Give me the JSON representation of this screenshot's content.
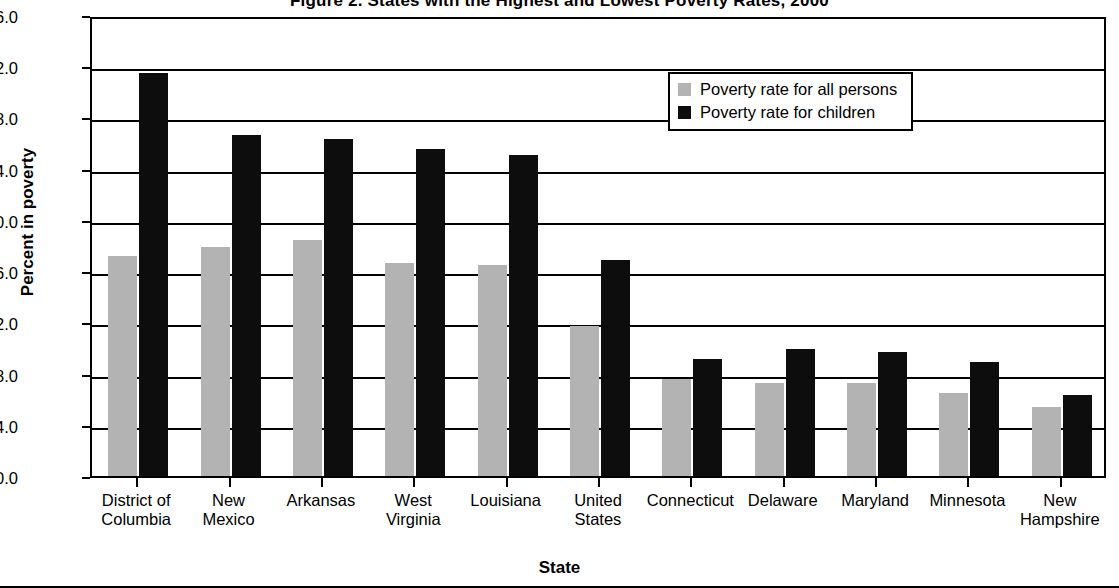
{
  "chart_data": {
    "type": "bar",
    "title": "Figure 2. States with the Highest and Lowest Poverty Rates, 2000",
    "xlabel": "State",
    "ylabel": "Percent in poverty",
    "ylim": [
      0.0,
      36.0
    ],
    "ytick_labels": [
      "0.0",
      "4.0",
      "8.0",
      "12.0",
      "16.0",
      "20.0",
      "24.0",
      "28.0",
      "32.0",
      "36.0"
    ],
    "ytick_values": [
      0.0,
      4.0,
      8.0,
      12.0,
      16.0,
      20.0,
      24.0,
      28.0,
      32.0,
      36.0
    ],
    "grid": true,
    "legend_position": "top-right",
    "categories": [
      "District of\nColumbia",
      "New\nMexico",
      "Arkansas",
      "West\nVirginia",
      "Louisiana",
      "United\nStates",
      "Connecticut",
      "Delaware",
      "Maryland",
      "Minnesota",
      "New\nHampshire"
    ],
    "series": [
      {
        "name": "Poverty rate for all persons",
        "color": "#b3b3b3",
        "values": [
          17.2,
          17.9,
          18.4,
          16.6,
          16.5,
          11.7,
          7.6,
          7.3,
          7.3,
          6.5,
          5.4
        ]
      },
      {
        "name": "Poverty rate for children",
        "color": "#0d0d0d",
        "values": [
          31.5,
          26.6,
          26.3,
          25.5,
          25.1,
          16.9,
          9.1,
          9.9,
          9.7,
          8.9,
          6.3
        ]
      }
    ]
  }
}
